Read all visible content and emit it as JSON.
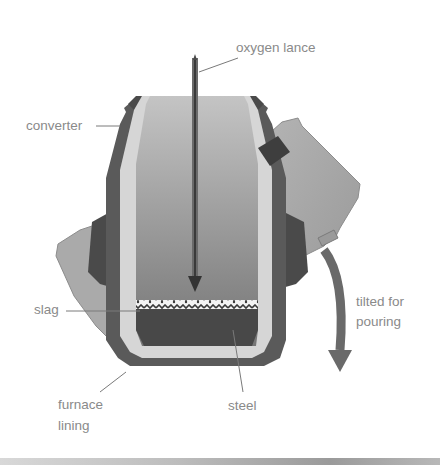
{
  "diagram": {
    "labels": {
      "oxygen_lance": "oxygen lance",
      "converter": "converter",
      "slag": "slag",
      "tilted_line1": "tilted for",
      "tilted_line2": "pouring",
      "furnace_line1": "furnace",
      "furnace_line2": "lining",
      "steel": "steel"
    },
    "colors": {
      "background": "#ffffff",
      "label_text": "#8a8a8a",
      "outer_shell": "#5a5a5a",
      "lining": "#d6d6d6",
      "interior_top": "#bdbdbd",
      "interior_bottom": "#7c7c7c",
      "steel": "#4a4a4a",
      "slag": "#f2f2f2",
      "tilted_shadow": "#a8a8a8",
      "trunnion": "#3e3e3e"
    }
  }
}
